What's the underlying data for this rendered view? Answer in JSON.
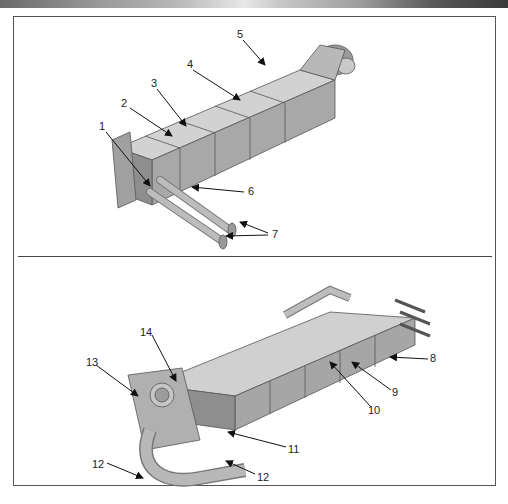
{
  "header": {
    "strip_colors": [
      "#6a6a6a",
      "#e8e8e8",
      "#3a3a3a"
    ]
  },
  "panels": [
    {
      "name": "top-view",
      "callouts": [
        {
          "label": "1",
          "x": 102,
          "y": 124
        },
        {
          "label": "2",
          "x": 124,
          "y": 101
        },
        {
          "label": "3",
          "x": 152,
          "y": 81
        },
        {
          "label": "4",
          "x": 187,
          "y": 62
        },
        {
          "label": "5",
          "x": 238,
          "y": 31
        },
        {
          "label": "6",
          "x": 247,
          "y": 189
        },
        {
          "label": "7",
          "x": 272,
          "y": 230
        }
      ]
    },
    {
      "name": "bottom-view",
      "callouts": [
        {
          "label": "8",
          "x": 430,
          "y": 356
        },
        {
          "label": "9",
          "x": 393,
          "y": 389
        },
        {
          "label": "10",
          "x": 370,
          "y": 407
        },
        {
          "label": "11",
          "x": 289,
          "y": 446
        },
        {
          "label": "12",
          "x": 94,
          "y": 462
        },
        {
          "label": "12",
          "x": 256,
          "y": 475
        },
        {
          "label": "13",
          "x": 88,
          "y": 361
        },
        {
          "label": "14",
          "x": 140,
          "y": 330
        }
      ]
    }
  ],
  "colors": {
    "part_fill": "#b4b4b4",
    "part_shade": "#8c8c8c",
    "part_light": "#d6d6d6",
    "outline": "#555555",
    "arrow": "#111111"
  }
}
